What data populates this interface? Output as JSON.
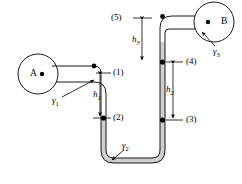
{
  "figure": {
    "type": "fluid-statics-manometer-diagram",
    "background_color": "#ffffff",
    "line_color": "#000000",
    "fluid_fill_color": "#cfcfcf",
    "tanks": [
      {
        "id": "A",
        "label": "A",
        "cx": 38,
        "cy": 74,
        "r": 20,
        "dot": true
      },
      {
        "id": "B",
        "label": "B",
        "cx": 214,
        "cy": 22,
        "r": 20,
        "dot": true
      }
    ],
    "fluids": [
      {
        "id": "gamma1",
        "label": "γ",
        "sub": "1",
        "x": 56,
        "y": 101
      },
      {
        "id": "gamma2",
        "label": "γ",
        "sub": "2",
        "x": 122,
        "y": 146
      },
      {
        "id": "gamma3",
        "label": "γ",
        "sub": "3",
        "x": 216,
        "y": 48
      }
    ],
    "points": [
      {
        "id": "p1",
        "label": "(1)",
        "x": 112,
        "y": 73,
        "tick_y": 73,
        "has_dot": false
      },
      {
        "id": "p2",
        "label": "(2)",
        "x": 112,
        "y": 118,
        "tick_y": 118,
        "has_dot": true
      },
      {
        "id": "p3",
        "label": "(3)",
        "x": 185,
        "y": 120,
        "tick_y": 120,
        "has_dot": true
      },
      {
        "id": "p4",
        "label": "(4)",
        "x": 185,
        "y": 62,
        "tick_y": 62,
        "has_dot": true
      },
      {
        "id": "p5",
        "label": "(5)",
        "x": 130,
        "y": 18,
        "tick_y": 18,
        "has_dot": false
      }
    ],
    "dimensions": [
      {
        "id": "h1",
        "label": "h",
        "sub": "1",
        "x": 99,
        "y": 95,
        "from_y": 73,
        "to_y": 118,
        "line_x": 100
      },
      {
        "id": "h2",
        "label": "h",
        "sub": "2",
        "x": 172,
        "y": 90,
        "from_y": 62,
        "to_y": 120,
        "line_x": 173
      },
      {
        "id": "h3",
        "label": "h",
        "sub": "3",
        "x": 139,
        "y": 40,
        "from_y": 18,
        "to_y": 62,
        "line_x": 142
      }
    ]
  }
}
